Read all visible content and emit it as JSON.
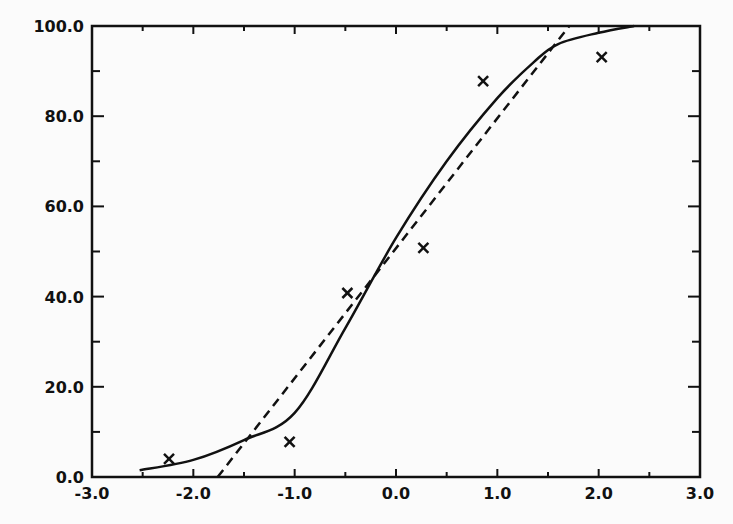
{
  "chart_data": {
    "type": "scatter",
    "title": "",
    "xlabel": "",
    "ylabel": "",
    "xlim": [
      -3.0,
      3.0
    ],
    "ylim": [
      0.0,
      100.0
    ],
    "grid": false,
    "legend": null,
    "x_ticks": [
      -3.0,
      -2.0,
      -1.0,
      0.0,
      1.0,
      2.0,
      3.0
    ],
    "x_tick_labels": [
      "-3.0",
      "-2.0",
      "-1.0",
      "0.0",
      "1.0",
      "2.0",
      "3.0"
    ],
    "y_ticks": [
      0.0,
      20.0,
      40.0,
      60.0,
      80.0,
      100.0
    ],
    "y_tick_labels": [
      "0.0",
      "20.0",
      "40.0",
      "60.0",
      "80.0",
      "100.0"
    ],
    "series": [
      {
        "name": "observed",
        "type": "scatter",
        "marker": "x",
        "x": [
          -2.24,
          -1.05,
          -0.48,
          0.27,
          0.86,
          2.03
        ],
        "y": [
          4.0,
          7.8,
          40.8,
          50.8,
          87.8,
          93.1
        ]
      },
      {
        "name": "fitted sigmoid (normal CDF)",
        "type": "line",
        "style": "solid",
        "x": [
          -2.53,
          -2.0,
          -1.5,
          -1.0,
          -0.5,
          0.0,
          0.5,
          1.0,
          1.36,
          1.6,
          2.0,
          2.35
        ],
        "y": [
          1.5,
          3.8,
          8.2,
          14.2,
          33.0,
          53.0,
          70.0,
          84.0,
          92.0,
          96.0,
          98.5,
          100.0
        ]
      },
      {
        "name": "fitted linear",
        "type": "line",
        "style": "dashed",
        "x": [
          -1.76,
          1.71
        ],
        "y": [
          0.0,
          100.0
        ]
      }
    ]
  }
}
